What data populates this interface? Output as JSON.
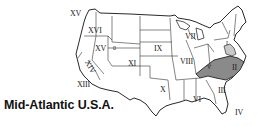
{
  "caption": "Mid-Atlantic U.S.A.",
  "highlight": {
    "region": "II",
    "color": "#8a8a8a",
    "secondary_color": "#c8c8c8"
  },
  "regions": [
    {
      "id": "XV_a",
      "label": "XV"
    },
    {
      "id": "XVI",
      "label": "XVI"
    },
    {
      "id": "XV_b",
      "label": "XV"
    },
    {
      "id": "mini",
      "label": "0"
    },
    {
      "id": "XIV",
      "label": "XIV"
    },
    {
      "id": "XIII",
      "label": "XIII"
    },
    {
      "id": "XI",
      "label": "XI"
    },
    {
      "id": "IX",
      "label": "IX"
    },
    {
      "id": "X",
      "label": "X"
    },
    {
      "id": "VII",
      "label": "VII"
    },
    {
      "id": "VIII",
      "label": "VIII"
    },
    {
      "id": "VI",
      "label": "VI"
    },
    {
      "id": "V",
      "label": "V"
    },
    {
      "id": "I",
      "label": "I"
    },
    {
      "id": "II",
      "label": "II"
    },
    {
      "id": "III",
      "label": "III"
    },
    {
      "id": "IV",
      "label": "IV"
    }
  ]
}
